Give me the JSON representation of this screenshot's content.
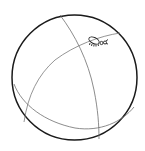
{
  "figure": {
    "colors": {
      "outline": "#1a1a1a",
      "curves": "#6e6e6e",
      "ant": "#222222",
      "background": "#ffffff"
    },
    "elements": [
      "sphere-outline",
      "meridian-curve",
      "equator-curve",
      "lower-curve",
      "ant"
    ]
  }
}
